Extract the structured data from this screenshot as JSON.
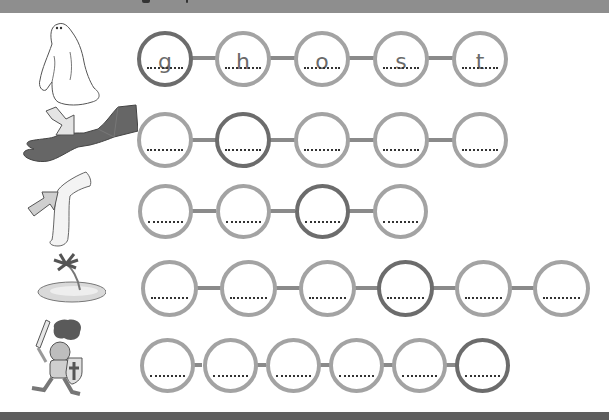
{
  "worksheet": {
    "title": "Phoneme segmentation worksheet",
    "colors": {
      "circle_border": "#a3a3a3",
      "circle_highlight": "#6c6c6c",
      "connector": "#8a8a8a",
      "top_bar": "#8e8e8e",
      "bottom_bar": "#5e5e5e"
    },
    "rows": [
      {
        "picture": "ghost",
        "picture_icon": "ghost-icon",
        "count": 5,
        "letters": [
          "g",
          "h",
          "o",
          "s",
          "t"
        ],
        "highlight_index": 0
      },
      {
        "picture": "wrist (arm with arrow)",
        "picture_icon": "wrist-icon",
        "count": 5,
        "letters": [
          "",
          "",
          "",
          "",
          ""
        ],
        "highlight_index": 1
      },
      {
        "picture": "knee (leg with arrow)",
        "picture_icon": "knee-icon",
        "count": 4,
        "letters": [
          "",
          "",
          "",
          ""
        ],
        "highlight_index": 2
      },
      {
        "picture": "island",
        "picture_icon": "island-icon",
        "count": 6,
        "letters": [
          "",
          "",
          "",
          "",
          "",
          ""
        ],
        "highlight_index": 3
      },
      {
        "picture": "knight",
        "picture_icon": "knight-icon",
        "count": 6,
        "letters": [
          "",
          "",
          "",
          "",
          "",
          ""
        ],
        "highlight_index": 5
      }
    ]
  },
  "r0": {
    "l0": "g",
    "l1": "h",
    "l2": "o",
    "l3": "s",
    "l4": "t"
  }
}
